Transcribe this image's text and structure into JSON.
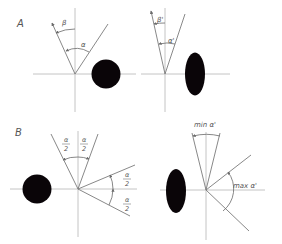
{
  "figure": {
    "panels": [
      {
        "id": "A",
        "label": "A",
        "left": {
          "angle_labels": {
            "beta": "β",
            "alpha": "α"
          },
          "object": "circle"
        },
        "right": {
          "angle_labels": {
            "beta_prime": "β'",
            "alpha_prime": "α'"
          },
          "object": "ellipse"
        }
      },
      {
        "id": "B",
        "label": "B",
        "left": {
          "half_angle_labels": [
            {
              "num": "α",
              "den": "2"
            },
            {
              "num": "α",
              "den": "2"
            },
            {
              "num": "α",
              "den": "2"
            },
            {
              "num": "α",
              "den": "2"
            }
          ],
          "object": "circle"
        },
        "right": {
          "min_label": "min α'",
          "max_label": "max α'",
          "object": "ellipse"
        }
      }
    ],
    "colors": {
      "object_fill": "#0a0508",
      "axis": "#b5b5b5",
      "ray": "#7a7a7a",
      "text": "#555555"
    }
  }
}
